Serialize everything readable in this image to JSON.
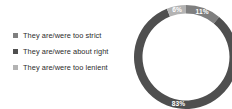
{
  "chart_data": {
    "type": "pie",
    "variant": "donut",
    "title": "",
    "subtitle": "",
    "xlabel": "",
    "ylabel": "",
    "legend_position": "left",
    "grid": false,
    "unit": "%",
    "categories": [
      "They are/were too strict",
      "They are/were about right",
      "They are/were too lenient"
    ],
    "values": [
      11,
      83,
      6
    ],
    "labels": [
      "11%",
      "83%",
      "6%"
    ],
    "colors": [
      "#7f7f7f",
      "#4f4f4f",
      "#b3b3b3"
    ],
    "slices": [
      {
        "name": "They are/were too strict",
        "value": 11,
        "label": "11%",
        "color": "#7f7f7f",
        "start_deg": 0,
        "end_deg": 39.6,
        "label_x": 195.0,
        "label_y": 8.0
      },
      {
        "name": "They are/were about right",
        "value": 83,
        "label": "83%",
        "color": "#4f4f4f",
        "start_deg": 39.6,
        "end_deg": 338.4,
        "label_x": 182.0,
        "label_y": 101.5
      },
      {
        "name": "They are/were too lenient",
        "value": 6,
        "label": "6%",
        "color": "#b3b3b3",
        "start_deg": 338.4,
        "end_deg": 360,
        "label_x": 173.0,
        "label_y": 7.5
      }
    ]
  },
  "legend": {
    "items": [
      {
        "label": "They are/were too strict",
        "color": "#7f7f7f"
      },
      {
        "label": "They are/were about right",
        "color": "#4f4f4f"
      },
      {
        "label": "They are/were too lenient",
        "color": "#b3b3b3"
      }
    ]
  }
}
